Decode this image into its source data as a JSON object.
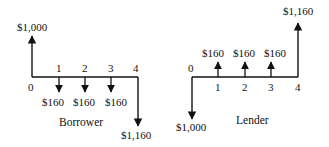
{
  "diagrams": [
    {
      "name": "borrower",
      "caption": "Borrower",
      "periods": [
        "0",
        "1",
        "2",
        "3",
        "4"
      ],
      "flows": [
        {
          "period": 0,
          "direction": "up",
          "label": "$1,000"
        },
        {
          "period": 1,
          "direction": "down",
          "label": "$160"
        },
        {
          "period": 2,
          "direction": "down",
          "label": "$160"
        },
        {
          "period": 3,
          "direction": "down",
          "label": "$160"
        },
        {
          "period": 4,
          "direction": "down",
          "label": "$1,160"
        }
      ]
    },
    {
      "name": "lender",
      "caption": "Lender",
      "periods": [
        "0",
        "1",
        "2",
        "3",
        "4"
      ],
      "flows": [
        {
          "period": 0,
          "direction": "down",
          "label": "$1,000"
        },
        {
          "period": 1,
          "direction": "up",
          "label": "$160"
        },
        {
          "period": 2,
          "direction": "up",
          "label": "$160"
        },
        {
          "period": 3,
          "direction": "up",
          "label": "$160"
        },
        {
          "period": 4,
          "direction": "up",
          "label": "$1,160"
        }
      ]
    }
  ]
}
